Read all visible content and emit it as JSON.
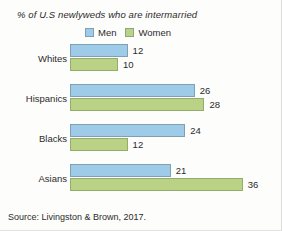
{
  "chart_data": {
    "type": "bar",
    "orientation": "horizontal",
    "title": "% of U.S newlyweds who are intermarried",
    "xlabel": "",
    "ylabel": "",
    "xlim": [
      0,
      40
    ],
    "grid": false,
    "legend_position": "top",
    "categories": [
      "Whites",
      "Hispanics",
      "Blacks",
      "Asians"
    ],
    "series": [
      {
        "name": "Men",
        "color": "#9ecbe8",
        "values": [
          12,
          26,
          24,
          21
        ]
      },
      {
        "name": "Women",
        "color": "#b9d285",
        "values": [
          10,
          28,
          12,
          36
        ]
      }
    ],
    "source": "Source: Livingston & Brown, 2017."
  },
  "legend": {
    "entries": [
      {
        "label": "Men",
        "color": "#9ecbe8"
      },
      {
        "label": "Women",
        "color": "#b9d285"
      }
    ]
  },
  "groups": [
    {
      "category": "Whites",
      "men": {
        "value": 12,
        "label": "12"
      },
      "women": {
        "value": 10,
        "label": "10"
      }
    },
    {
      "category": "Hispanics",
      "men": {
        "value": 26,
        "label": "26"
      },
      "women": {
        "value": 28,
        "label": "28"
      }
    },
    {
      "category": "Blacks",
      "men": {
        "value": 24,
        "label": "24"
      },
      "women": {
        "value": 12,
        "label": "12"
      }
    },
    {
      "category": "Asians",
      "men": {
        "value": 21,
        "label": "21"
      },
      "women": {
        "value": 36,
        "label": "36"
      }
    }
  ],
  "scale": {
    "px_per_unit": 4.8,
    "origin_x": 70
  }
}
